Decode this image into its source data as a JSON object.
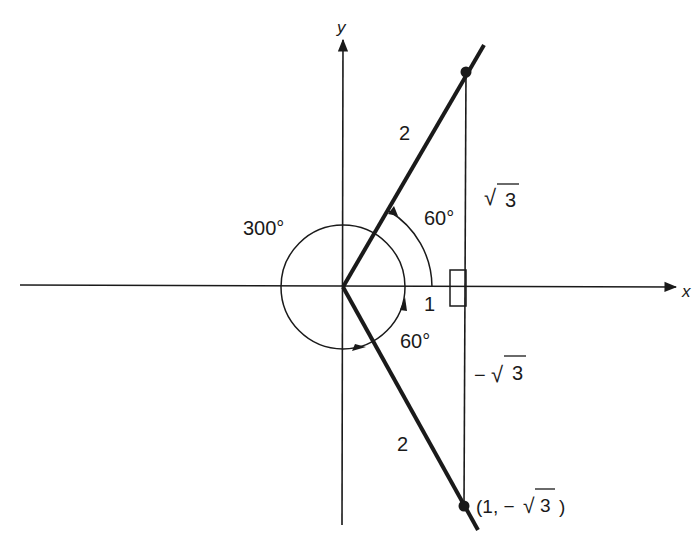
{
  "figure": {
    "axes": {
      "x_label": "x",
      "y_label": "y"
    },
    "labels": {
      "angle_300": "300°",
      "angle_60_upper": "60°",
      "angle_60_lower": "60°",
      "hyp_upper": "2",
      "hyp_lower": "2",
      "adjacent": "1",
      "opposite_upper_sqrt": "√",
      "opposite_upper_num": "3",
      "opposite_lower_minus": "−",
      "opposite_lower_sqrt": "√",
      "opposite_lower_num": "3",
      "point_label_open": "(1, −",
      "point_label_sqrt": "√",
      "point_label_num": "3",
      "point_label_close": ")"
    },
    "colors": {
      "ink": "#1a1a1a",
      "background": "#ffffff"
    }
  }
}
